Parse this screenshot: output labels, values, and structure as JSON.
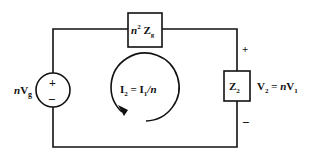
{
  "diagram": {
    "title": "",
    "source": {
      "label_prefix": "n",
      "label_main": "V",
      "label_sub": "g",
      "plus": "+",
      "minus": "−"
    },
    "series_impedance": {
      "prefix": "n",
      "sup": "2",
      "main": "Z",
      "sub": "g"
    },
    "load_impedance": {
      "main": "Z",
      "sub": "2"
    },
    "output_voltage": {
      "lhs_main": "V",
      "lhs_sub": "2",
      "eq": " = ",
      "rhs_prefix": "n",
      "rhs_main": "V",
      "rhs_sub": "1",
      "plus": "+",
      "minus": "−"
    },
    "loop_current": {
      "lhs_main": "I",
      "lhs_sub": "2",
      "eq": " = ",
      "rhs_main": "I",
      "rhs_sub": "1",
      "rhs_suffix": "/n"
    }
  }
}
